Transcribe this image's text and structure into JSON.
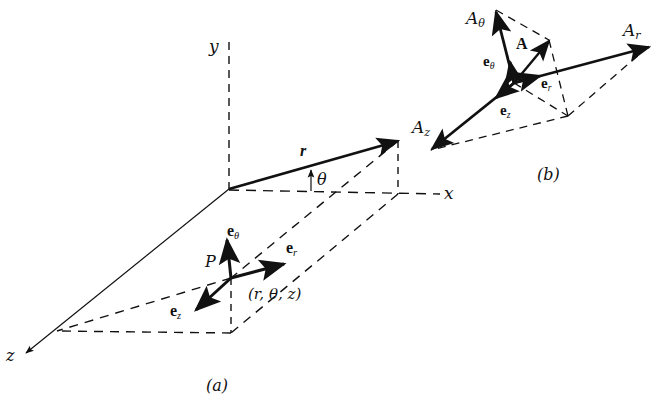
{
  "diagram": {
    "type": "cylindrical-coordinate-system",
    "colors": {
      "ink": "#111111",
      "background": "#ffffff"
    },
    "panel_a": {
      "caption": "(a)",
      "axes": {
        "x": "x",
        "y": "y",
        "z": "z"
      },
      "vector_r": "r",
      "angle": "θ",
      "point": "P",
      "point_coords": "(r, θ, z)",
      "unit_vectors": {
        "e_theta": "e",
        "e_theta_sub": "θ",
        "e_r": "e",
        "e_r_sub": "r",
        "e_z": "e",
        "e_z_sub": "z"
      }
    },
    "panel_b": {
      "caption": "(b)",
      "vector": "A",
      "components": {
        "A_theta": "A",
        "A_theta_sub": "θ",
        "A_r": "A",
        "A_r_sub": "r",
        "A_z": "A",
        "A_z_sub": "z"
      },
      "unit_vectors": {
        "e_theta": "e",
        "e_theta_sub": "θ",
        "e_r": "e",
        "e_r_sub": "r",
        "e_z": "e",
        "e_z_sub": "z"
      }
    }
  }
}
